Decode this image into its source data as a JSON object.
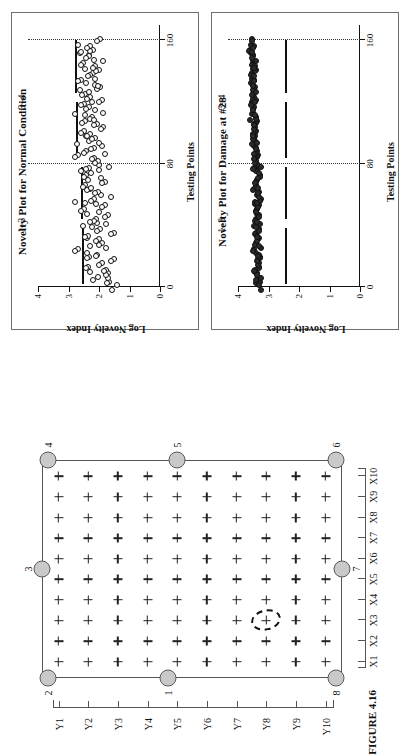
{
  "figure": {
    "caption": "FIGURE 4.16",
    "rotation_deg": -90
  },
  "panels": [
    {
      "id": "normal",
      "title": "Novelty Plot for Normal Condition",
      "xlabel": "Testing Points",
      "ylabel": "Log Novelty Index",
      "group_left": "1–3",
      "group_right": "3–4"
    },
    {
      "id": "damage",
      "title": "Novelty Plot for Damage at #28",
      "xlabel": "Testing Points",
      "ylabel": "Log Novelty Index",
      "group_left": "1–3",
      "group_right": "3–4"
    }
  ],
  "chart_data": [
    {
      "type": "scatter",
      "title": "Novelty Plot for Normal Condition",
      "xlabel": "Testing Points",
      "ylabel": "Log Novelty Index",
      "xlim": [
        0,
        170
      ],
      "ylim": [
        0,
        4
      ],
      "xticks": [
        0,
        80,
        160
      ],
      "yticks": [
        0,
        1,
        2,
        3,
        4
      ],
      "grid": false,
      "annotations": [
        "1–3",
        "3–4"
      ],
      "vertical_dividers": [
        80,
        160
      ],
      "threshold_segments": [
        {
          "x0": 2,
          "x1": 38,
          "y": 2.55
        },
        {
          "x0": 44,
          "x1": 78,
          "y": 2.6
        },
        {
          "x0": 84,
          "x1": 120,
          "y": 2.75
        },
        {
          "x0": 126,
          "x1": 160,
          "y": 2.8
        }
      ],
      "marker": "open-circle",
      "x": [
        1,
        3,
        5,
        7,
        9,
        11,
        13,
        15,
        17,
        19,
        21,
        23,
        25,
        27,
        29,
        31,
        33,
        35,
        37,
        39,
        41,
        43,
        45,
        47,
        49,
        51,
        53,
        55,
        57,
        59,
        61,
        63,
        65,
        67,
        69,
        71,
        73,
        75,
        77,
        79,
        81,
        83,
        85,
        87,
        89,
        91,
        93,
        95,
        97,
        99,
        101,
        103,
        105,
        107,
        109,
        111,
        113,
        115,
        117,
        119,
        121,
        123,
        125,
        127,
        129,
        131,
        133,
        135,
        137,
        139,
        141,
        143,
        145,
        147,
        149,
        151,
        153,
        155,
        157,
        159
      ],
      "y": [
        1.75,
        1.55,
        1.9,
        2.1,
        1.65,
        2.35,
        1.8,
        2.0,
        2.45,
        1.7,
        2.2,
        1.95,
        2.6,
        1.85,
        2.3,
        2.05,
        1.6,
        2.5,
        2.15,
        1.9,
        2.4,
        2.0,
        2.25,
        1.7,
        2.55,
        2.1,
        1.95,
        2.35,
        2.6,
        1.8,
        2.2,
        2.0,
        2.45,
        2.3,
        1.9,
        2.55,
        2.1,
        2.4,
        1.85,
        2.25,
        2.0,
        2.7,
        2.2,
        2.5,
        1.95,
        2.35,
        2.15,
        2.6,
        2.05,
        2.45,
        2.3,
        1.9,
        2.55,
        2.2,
        2.4,
        2.0,
        2.65,
        2.25,
        2.1,
        2.5,
        2.35,
        2.0,
        2.6,
        2.15,
        2.45,
        2.3,
        1.95,
        2.55,
        2.2,
        2.4,
        2.1,
        2.65,
        2.3,
        2.0,
        2.5,
        2.25,
        2.15,
        2.6,
        2.35,
        2.05
      ]
    },
    {
      "type": "scatter",
      "title": "Novelty Plot for Damage at #28",
      "xlabel": "Testing Points",
      "ylabel": "Log Novelty Index",
      "xlim": [
        0,
        170
      ],
      "ylim": [
        0,
        4
      ],
      "xticks": [
        0,
        80,
        160
      ],
      "yticks": [
        0,
        1,
        2,
        3,
        4
      ],
      "grid": false,
      "annotations": [
        "1–3",
        "3–4"
      ],
      "vertical_dividers": [
        80,
        160
      ],
      "threshold_segments": [
        {
          "x0": 2,
          "x1": 38,
          "y": 2.45
        },
        {
          "x0": 44,
          "x1": 78,
          "y": 2.45
        },
        {
          "x0": 84,
          "x1": 120,
          "y": 2.45
        },
        {
          "x0": 126,
          "x1": 160,
          "y": 2.45
        }
      ],
      "marker": "filled-circle",
      "x": [
        1,
        3,
        5,
        7,
        9,
        11,
        13,
        15,
        17,
        19,
        21,
        23,
        25,
        27,
        29,
        31,
        33,
        35,
        37,
        39,
        41,
        43,
        45,
        47,
        49,
        51,
        53,
        55,
        57,
        59,
        61,
        63,
        65,
        67,
        69,
        71,
        73,
        75,
        77,
        79,
        81,
        83,
        85,
        87,
        89,
        91,
        93,
        95,
        97,
        99,
        101,
        103,
        105,
        107,
        109,
        111,
        113,
        115,
        117,
        119,
        121,
        123,
        125,
        127,
        129,
        131,
        133,
        135,
        137,
        139,
        141,
        143,
        145,
        147,
        149,
        151,
        153,
        155,
        157,
        159
      ],
      "y": [
        3.3,
        3.35,
        3.3,
        3.4,
        3.35,
        3.3,
        3.45,
        3.35,
        3.3,
        3.4,
        3.35,
        3.3,
        3.45,
        3.4,
        3.3,
        3.35,
        3.45,
        3.4,
        3.35,
        3.3,
        3.45,
        3.4,
        3.35,
        3.3,
        3.4,
        3.45,
        3.35,
        3.3,
        3.4,
        3.35,
        3.45,
        3.3,
        3.4,
        3.35,
        3.45,
        3.3,
        3.4,
        3.35,
        3.3,
        3.45,
        3.4,
        3.35,
        3.45,
        3.4,
        3.5,
        3.45,
        3.4,
        3.5,
        3.45,
        3.4,
        3.5,
        3.45,
        3.4,
        3.5,
        3.45,
        3.55,
        3.5,
        3.45,
        3.5,
        3.55,
        3.5,
        3.45,
        3.55,
        3.5,
        3.45,
        3.55,
        3.5,
        3.45,
        3.55,
        3.5,
        3.45,
        3.55,
        3.5,
        3.45,
        3.55,
        3.5,
        3.6,
        3.55,
        3.5,
        3.55
      ]
    }
  ],
  "grid_figure": {
    "x_axis_labels": [
      "X1",
      "X2",
      "X3",
      "X4",
      "X5",
      "X6",
      "X7",
      "X8",
      "X9",
      "X10"
    ],
    "y_axis_labels": [
      "Y1",
      "Y2",
      "Y3",
      "Y4",
      "Y5",
      "Y6",
      "Y7",
      "Y8",
      "Y9",
      "Y10"
    ],
    "sensor_labels": [
      "1",
      "2",
      "3",
      "4",
      "5",
      "6",
      "7",
      "8"
    ],
    "sensors": [
      {
        "label": "1",
        "xp": 0.0,
        "yp": 0.42
      },
      {
        "label": "2",
        "xp": 0.0,
        "yp": 0.02
      },
      {
        "label": "3",
        "xp": 0.5,
        "yp": 0.0
      },
      {
        "label": "4",
        "xp": 1.0,
        "yp": 0.02
      },
      {
        "label": "5",
        "xp": 1.0,
        "yp": 0.45
      },
      {
        "label": "6",
        "xp": 1.0,
        "yp": 0.98
      },
      {
        "label": "7",
        "xp": 0.5,
        "yp": 1.0
      },
      {
        "label": "8",
        "xp": 0.0,
        "yp": 0.98
      }
    ],
    "damage_marker": {
      "col": 3,
      "row": 8,
      "shape": "dashed-ellipse"
    }
  },
  "colors": {
    "ink": "#111111",
    "panel_border": "#6f6f6f",
    "plate_border": "#555555",
    "sensor_fill": "#c9c9c9",
    "sensor_stroke": "#5a5a5a",
    "background": "#ffffff"
  }
}
